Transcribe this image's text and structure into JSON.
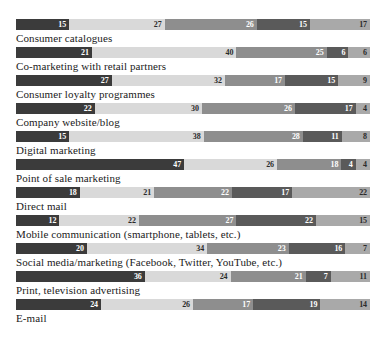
{
  "header": {
    "clipped_text": ""
  },
  "chart_data": {
    "type": "bar",
    "subtype": "stacked-horizontal-100",
    "title": "",
    "xlabel": "",
    "ylabel": "",
    "grid": false,
    "legend_position": "none",
    "xlim": [
      0,
      100
    ],
    "categories": [
      "Consumer catalogues",
      "Co-marketing with retail partners",
      "Consumer loyalty programmes",
      "Company website/blog",
      "Digital marketing",
      "Point of sale marketing",
      "Direct mail",
      "Mobile communication (smartphone, tablets, etc.)",
      "Social media/marketing (Facebook, Twitter, YouTube, etc.)",
      "Print, television advertising",
      "E-mail"
    ],
    "series": [
      {
        "name": "series-1",
        "color": "#3b3b3b",
        "values": [
          15,
          21,
          27,
          22,
          15,
          47,
          18,
          12,
          20,
          36,
          24
        ]
      },
      {
        "name": "series-2",
        "color": "#d9d9d9",
        "values": [
          27,
          40,
          32,
          30,
          38,
          26,
          21,
          22,
          34,
          24,
          26
        ]
      },
      {
        "name": "series-3",
        "color": "#8e8e8e",
        "values": [
          26,
          25,
          17,
          26,
          28,
          18,
          22,
          27,
          23,
          21,
          17
        ]
      },
      {
        "name": "series-4",
        "color": "#5a5a5a",
        "values": [
          15,
          6,
          15,
          17,
          11,
          4,
          17,
          22,
          16,
          7,
          19
        ]
      },
      {
        "name": "series-5",
        "color": "#a9a9a9",
        "values": [
          17,
          6,
          9,
          4,
          8,
          4,
          22,
          15,
          7,
          11,
          14
        ]
      }
    ],
    "rows": [
      {
        "label": "Consumer catalogues",
        "values": [
          15,
          27,
          26,
          15,
          17
        ]
      },
      {
        "label": "Co-marketing with retail partners",
        "values": [
          21,
          40,
          25,
          6,
          6
        ]
      },
      {
        "label": "Consumer loyalty programmes",
        "values": [
          27,
          32,
          17,
          15,
          9
        ]
      },
      {
        "label": "Company website/blog",
        "values": [
          22,
          30,
          26,
          17,
          4
        ]
      },
      {
        "label": "Digital marketing",
        "values": [
          15,
          38,
          28,
          11,
          8
        ]
      },
      {
        "label": "Point of sale marketing",
        "values": [
          47,
          26,
          18,
          4,
          4
        ]
      },
      {
        "label": "Direct mail",
        "values": [
          18,
          21,
          22,
          17,
          22
        ]
      },
      {
        "label": "Mobile communication (smartphone, tablets, etc.)",
        "values": [
          12,
          22,
          27,
          22,
          15
        ]
      },
      {
        "label": "Social media/marketing (Facebook, Twitter, YouTube, etc.)",
        "values": [
          20,
          34,
          23,
          16,
          7
        ]
      },
      {
        "label": "Print, television advertising",
        "values": [
          36,
          24,
          21,
          7,
          11
        ]
      },
      {
        "label": "E-mail",
        "values": [
          24,
          26,
          17,
          19,
          14
        ]
      }
    ],
    "colors": [
      "#3b3b3b",
      "#d9d9d9",
      "#8e8e8e",
      "#5a5a5a",
      "#a9a9a9"
    ]
  }
}
